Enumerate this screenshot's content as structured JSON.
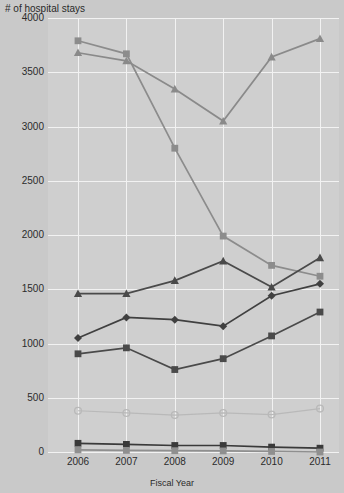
{
  "chart_data": {
    "type": "line",
    "title": "# of hospital stays",
    "xlabel": "Fiscal Year",
    "ylabel": "",
    "categories": [
      "2006",
      "2007",
      "2008",
      "2009",
      "2010",
      "2011"
    ],
    "x": [
      2006,
      2007,
      2008,
      2009,
      2010,
      2011
    ],
    "ylim": [
      0,
      4000
    ],
    "yticks": [
      0,
      500,
      1000,
      1500,
      2000,
      2500,
      3000,
      3500,
      4000
    ],
    "ytick_labels": [
      "0",
      "500",
      "1000",
      "1500",
      "2000",
      "2500",
      "3000",
      "3500",
      "4000"
    ],
    "grid": true,
    "legend": "none",
    "series": [
      {
        "name": "series-1",
        "marker": "square",
        "color": "#8c8c8c",
        "values": [
          3790,
          3670,
          2800,
          1990,
          1720,
          1620
        ]
      },
      {
        "name": "series-2",
        "marker": "triangle",
        "color": "#8a8a8a",
        "values": [
          3680,
          3605,
          3345,
          3050,
          3640,
          3810
        ]
      },
      {
        "name": "series-3",
        "marker": "triangle",
        "color": "#4a4a4a",
        "values": [
          1460,
          1460,
          1580,
          1760,
          1520,
          1790
        ]
      },
      {
        "name": "series-4",
        "marker": "diamond",
        "color": "#404040",
        "values": [
          1050,
          1240,
          1220,
          1160,
          1440,
          1550
        ]
      },
      {
        "name": "series-5",
        "marker": "square",
        "color": "#4a4a4a",
        "values": [
          905,
          960,
          760,
          860,
          1070,
          1290
        ]
      },
      {
        "name": "series-6",
        "marker": "circle",
        "color": "#b9b9b9",
        "values": [
          380,
          360,
          340,
          360,
          345,
          400
        ]
      },
      {
        "name": "series-7",
        "marker": "square",
        "color": "#3a3a3a",
        "values": [
          80,
          70,
          60,
          60,
          45,
          35
        ]
      },
      {
        "name": "series-8",
        "marker": "square",
        "color": "#8f8f8f",
        "values": [
          20,
          15,
          12,
          10,
          5,
          0
        ]
      }
    ]
  }
}
